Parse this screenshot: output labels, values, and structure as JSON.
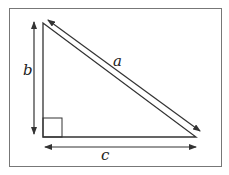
{
  "diagram": {
    "type": "right-triangle",
    "labels": {
      "hypotenuse": "a",
      "vertical_side": "b",
      "horizontal_side": "c"
    },
    "right_angle_marker": true,
    "colors": {
      "stroke": "#333333",
      "frame": "#777777",
      "background": "#ffffff"
    }
  }
}
